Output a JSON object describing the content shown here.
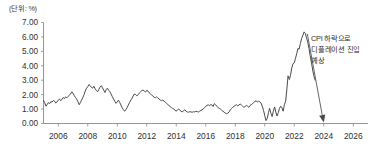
{
  "chart_data": {
    "type": "line",
    "title": "",
    "subtitle": "",
    "unit_label": "(단위: %)",
    "xlabel": "",
    "ylabel": "",
    "ylim": [
      0.0,
      7.0
    ],
    "xlim": [
      2005.0,
      2027.0
    ],
    "grid": false,
    "legend": null,
    "y_ticks": [
      "0.00",
      "1.00",
      "2.00",
      "3.00",
      "4.00",
      "5.00",
      "6.00",
      "7.00"
    ],
    "y_tick_values": [
      0,
      1,
      2,
      3,
      4,
      5,
      6,
      7
    ],
    "x_ticks": [
      "2006",
      "2008",
      "2010",
      "2012",
      "2014",
      "2016",
      "2018",
      "2020",
      "2022",
      "2024",
      "2026"
    ],
    "x_tick_values": [
      2006,
      2008,
      2010,
      2012,
      2014,
      2016,
      2018,
      2020,
      2022,
      2024,
      2026
    ],
    "series": [
      {
        "name": "CPI",
        "color": "#4a4a4a",
        "x": [
          2005.0,
          2005.08,
          2005.17,
          2005.25,
          2005.33,
          2005.42,
          2005.5,
          2005.58,
          2005.67,
          2005.75,
          2005.83,
          2005.92,
          2006.0,
          2006.08,
          2006.17,
          2006.25,
          2006.33,
          2006.42,
          2006.5,
          2006.58,
          2006.67,
          2006.75,
          2006.83,
          2006.92,
          2007.0,
          2007.08,
          2007.17,
          2007.25,
          2007.33,
          2007.42,
          2007.5,
          2007.58,
          2007.67,
          2007.75,
          2007.83,
          2007.92,
          2008.0,
          2008.08,
          2008.17,
          2008.25,
          2008.33,
          2008.42,
          2008.5,
          2008.58,
          2008.67,
          2008.75,
          2008.83,
          2008.92,
          2009.0,
          2009.08,
          2009.17,
          2009.25,
          2009.33,
          2009.42,
          2009.5,
          2009.58,
          2009.67,
          2009.75,
          2009.83,
          2009.92,
          2010.0,
          2010.08,
          2010.17,
          2010.25,
          2010.33,
          2010.42,
          2010.5,
          2010.58,
          2010.67,
          2010.75,
          2010.83,
          2010.92,
          2011.0,
          2011.08,
          2011.17,
          2011.25,
          2011.33,
          2011.42,
          2011.5,
          2011.58,
          2011.67,
          2011.75,
          2011.83,
          2011.92,
          2012.0,
          2012.08,
          2012.17,
          2012.25,
          2012.33,
          2012.42,
          2012.5,
          2012.58,
          2012.67,
          2012.75,
          2012.83,
          2012.92,
          2013.0,
          2013.08,
          2013.17,
          2013.25,
          2013.33,
          2013.42,
          2013.5,
          2013.58,
          2013.67,
          2013.75,
          2013.83,
          2013.92,
          2014.0,
          2014.08,
          2014.17,
          2014.25,
          2014.33,
          2014.42,
          2014.5,
          2014.58,
          2014.67,
          2014.75,
          2014.83,
          2014.92,
          2015.0,
          2015.08,
          2015.17,
          2015.25,
          2015.33,
          2015.42,
          2015.5,
          2015.58,
          2015.67,
          2015.75,
          2015.83,
          2015.92,
          2016.0,
          2016.08,
          2016.17,
          2016.25,
          2016.33,
          2016.42,
          2016.5,
          2016.58,
          2016.67,
          2016.75,
          2016.83,
          2016.92,
          2017.0,
          2017.08,
          2017.17,
          2017.25,
          2017.33,
          2017.42,
          2017.5,
          2017.58,
          2017.67,
          2017.75,
          2017.83,
          2017.92,
          2018.0,
          2018.08,
          2018.17,
          2018.25,
          2018.33,
          2018.42,
          2018.5,
          2018.58,
          2018.67,
          2018.75,
          2018.83,
          2018.92,
          2019.0,
          2019.08,
          2019.17,
          2019.25,
          2019.33,
          2019.42,
          2019.5,
          2019.58,
          2019.67,
          2019.75,
          2019.83,
          2019.92,
          2020.0,
          2020.08,
          2020.17,
          2020.25,
          2020.33,
          2020.42,
          2020.5,
          2020.58,
          2020.67,
          2020.75,
          2020.83,
          2020.92,
          2021.0,
          2021.08,
          2021.17,
          2021.25,
          2021.33,
          2021.42,
          2021.5,
          2021.58,
          2021.67,
          2021.75,
          2021.83,
          2021.92,
          2022.0,
          2022.08,
          2022.17,
          2022.25,
          2022.33,
          2022.42,
          2022.5,
          2022.58,
          2022.67,
          2022.75,
          2022.83,
          2022.92,
          2023.0,
          2023.08,
          2023.17,
          2023.25,
          2023.33,
          2023.42
        ],
        "values": [
          1.6,
          1.45,
          1.2,
          1.32,
          1.45,
          1.38,
          1.52,
          1.48,
          1.6,
          1.55,
          1.42,
          1.5,
          1.62,
          1.7,
          1.58,
          1.68,
          1.8,
          1.72,
          1.85,
          1.78,
          1.88,
          1.95,
          2.05,
          2.2,
          2.1,
          1.95,
          1.8,
          1.68,
          1.52,
          1.3,
          1.45,
          1.62,
          1.8,
          2.0,
          2.25,
          2.45,
          2.55,
          2.7,
          2.62,
          2.5,
          2.45,
          2.58,
          2.4,
          2.3,
          2.2,
          2.35,
          2.52,
          2.62,
          2.48,
          2.3,
          2.15,
          2.35,
          2.45,
          2.3,
          2.2,
          2.05,
          1.85,
          1.7,
          1.55,
          1.4,
          1.5,
          1.62,
          1.45,
          1.28,
          1.1,
          0.95,
          0.85,
          0.95,
          1.1,
          1.28,
          1.45,
          1.62,
          1.75,
          1.9,
          2.05,
          2.0,
          1.92,
          2.0,
          2.12,
          2.2,
          2.28,
          2.32,
          2.25,
          2.18,
          2.3,
          2.25,
          2.12,
          2.05,
          1.98,
          1.9,
          1.82,
          1.78,
          1.85,
          1.78,
          1.7,
          1.62,
          1.58,
          1.62,
          1.55,
          1.48,
          1.4,
          1.32,
          1.25,
          1.18,
          1.1,
          1.05,
          1.0,
          0.92,
          0.85,
          0.95,
          1.0,
          0.92,
          0.85,
          0.8,
          0.9,
          0.95,
          0.85,
          0.8,
          0.78,
          0.82,
          0.8,
          0.78,
          0.82,
          0.8,
          0.85,
          0.82,
          0.8,
          0.85,
          0.9,
          0.95,
          1.0,
          1.1,
          1.2,
          1.25,
          1.3,
          1.22,
          1.32,
          1.28,
          1.18,
          1.38,
          1.3,
          1.2,
          1.1,
          1.05,
          1.0,
          0.92,
          0.85,
          0.78,
          0.72,
          0.68,
          0.72,
          0.8,
          0.95,
          1.05,
          1.12,
          1.2,
          1.25,
          1.3,
          1.22,
          1.28,
          1.35,
          1.28,
          1.2,
          1.12,
          1.18,
          1.25,
          1.2,
          1.12,
          1.25,
          1.3,
          1.38,
          1.45,
          1.52,
          1.58,
          1.48,
          1.55,
          1.5,
          1.42,
          1.2,
          0.9,
          0.55,
          0.2,
          0.35,
          0.75,
          1.05,
          0.7,
          0.48,
          0.85,
          1.15,
          0.8,
          0.52,
          0.75,
          1.05,
          1.2,
          1.08,
          0.85,
          1.3,
          1.55,
          2.4,
          3.3,
          3.05,
          3.35,
          3.85,
          4.15,
          4.2,
          4.5,
          4.85,
          5.2,
          5.15,
          5.55,
          5.9,
          6.1,
          6.35,
          6.25,
          5.95,
          5.6,
          5.2,
          4.7,
          4.2,
          3.7,
          3.3,
          3.0
        ]
      }
    ],
    "annotations": [
      {
        "name": "deflation-forecast",
        "lines": [
          "CPI 하락으로",
          "디플레이션 진입",
          "예상"
        ],
        "arrow_from_x": 2022.75,
        "arrow_from_y": 6.35,
        "arrow_to_x": 2024.0,
        "arrow_to_y": 0.0
      }
    ]
  }
}
